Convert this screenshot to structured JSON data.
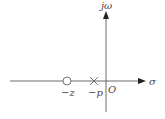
{
  "diagram": {
    "type": "pole-zero-plot",
    "axes": {
      "vertical_label": "jω",
      "horizontal_label": "σ",
      "origin_label": "O"
    },
    "markers": [
      {
        "kind": "zero",
        "symbol": "circle",
        "label": "−z"
      },
      {
        "kind": "pole",
        "symbol": "cross",
        "label": "−p"
      }
    ],
    "colors": {
      "line": "#333333",
      "text": "#444444"
    }
  }
}
